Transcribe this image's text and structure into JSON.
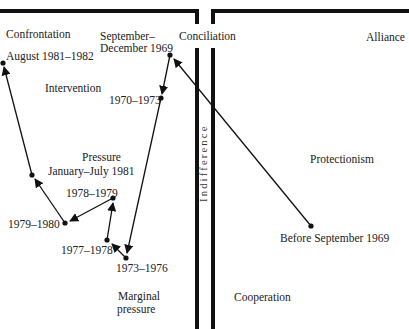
{
  "regions": {
    "confrontation": "Confrontation",
    "conciliation": "Conciliation",
    "alliance": "Alliance",
    "intervention": "Intervention",
    "pressure": "Pressure",
    "indifference": "Indifference",
    "protectionism": "Protectionism",
    "marginal_pressure_line1": "Marginal",
    "marginal_pressure_line2": "pressure",
    "cooperation": "Cooperation"
  },
  "periods": [
    {
      "id": "before-sep-1969",
      "label": "Before September 1969",
      "x": 311,
      "y": 226
    },
    {
      "id": "sep-dec-1969",
      "label_line1": "September–",
      "label_line2": "December 1969",
      "x": 170,
      "y": 55
    },
    {
      "id": "1970-1973",
      "label": "1970–1973",
      "x": 161,
      "y": 98
    },
    {
      "id": "1973-1976",
      "label": "1973–1976",
      "x": 126,
      "y": 258
    },
    {
      "id": "1977-1978",
      "label": "1977–1978",
      "x": 107,
      "y": 240
    },
    {
      "id": "1978-1979",
      "label": "1978–1979",
      "x": 113,
      "y": 198
    },
    {
      "id": "1979-1980",
      "label": "1979–1980",
      "x": 65,
      "y": 223
    },
    {
      "id": "jan-jul-1981",
      "label": "January–July 1981",
      "x": 32,
      "y": 175
    },
    {
      "id": "aug-1981-1982",
      "label": "August 1981–1982",
      "x": 3,
      "y": 63
    }
  ],
  "trajectory_order": [
    "before-sep-1969",
    "sep-dec-1969",
    "1970-1973",
    "1973-1976",
    "1977-1978",
    "1978-1979",
    "1979-1980",
    "jan-jul-1981",
    "aug-1981-1982"
  ],
  "colors": {
    "ink": "#111111",
    "text": "#222222",
    "background": "#ffffff"
  }
}
